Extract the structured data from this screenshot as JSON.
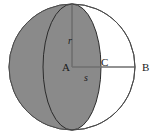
{
  "figure": {
    "labels": {
      "radius": "r",
      "segment": "s",
      "center": "A",
      "cap_point": "C",
      "edge_point": "B"
    },
    "colors": {
      "shaded_fill": "#8a8a8a",
      "unshaded_fill": "#ffffff",
      "outline": "#4a4a4a",
      "measure_line": "#6e6e6e",
      "text": "#1a1a1a",
      "background": "#ffffff"
    },
    "geometry": {
      "circle_center_x": 72,
      "circle_center_y": 67,
      "circle_radius": 63,
      "front_ellipse_rx": 29,
      "back_ellipse_rx": 29,
      "point_C_x": 100,
      "point_B_x": 135
    }
  }
}
